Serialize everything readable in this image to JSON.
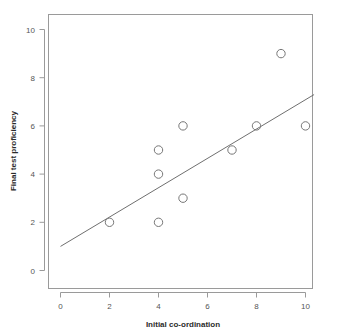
{
  "chart_data": {
    "type": "scatter",
    "title": "",
    "subtitle": "",
    "xlabel": "Initial co-ordination",
    "ylabel": "Final test proficiency",
    "xlim": [
      -0.45,
      10.6
    ],
    "ylim": [
      -0.55,
      10.7
    ],
    "xticks": [
      0,
      2,
      4,
      6,
      8,
      10
    ],
    "yticks": [
      0,
      2,
      4,
      6,
      8,
      10
    ],
    "xtick_labels": [
      "0",
      "2",
      "4",
      "6",
      "8",
      "10"
    ],
    "ytick_labels": [
      "0",
      "2",
      "4",
      "6",
      "8",
      "10"
    ],
    "grid": false,
    "legend": null,
    "marker": "open-circle",
    "marker_color": "#777777",
    "points": [
      {
        "x": 2,
        "y": 2
      },
      {
        "x": 4,
        "y": 2
      },
      {
        "x": 4,
        "y": 4
      },
      {
        "x": 4,
        "y": 5
      },
      {
        "x": 5,
        "y": 3
      },
      {
        "x": 5,
        "y": 6
      },
      {
        "x": 7,
        "y": 5
      },
      {
        "x": 8,
        "y": 6
      },
      {
        "x": 9,
        "y": 9
      },
      {
        "x": 10,
        "y": 6
      }
    ],
    "annotations": [
      {
        "type": "regression-line",
        "label": "",
        "color": "#6f6f6f",
        "x0": 0.0,
        "y0": 1.0,
        "x1": 10.35,
        "y1": 7.3
      }
    ]
  },
  "colors": {
    "background": "#ffffff",
    "axis": "#9a9a9a",
    "tick_label": "#555555",
    "axis_title": "#2b2b2b",
    "marker": "#777777",
    "line": "#6f6f6f"
  }
}
